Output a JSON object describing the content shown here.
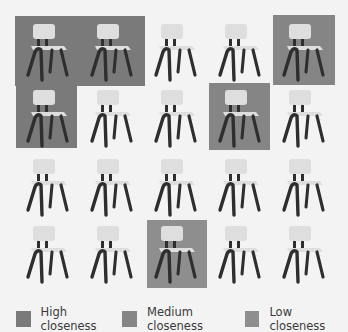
{
  "figure": {
    "grid": {
      "rows": 4,
      "cols": 5,
      "item": "chair"
    },
    "highlights": [
      {
        "label": "row0-cols0-1",
        "level": "high",
        "x": 15,
        "y": 16,
        "w": 130,
        "h": 70
      },
      {
        "label": "row1-col0",
        "level": "high",
        "x": 16,
        "y": 85,
        "w": 61,
        "h": 63
      },
      {
        "label": "row0-col4",
        "level": "medium",
        "x": 273,
        "y": 15,
        "w": 62,
        "h": 70
      },
      {
        "label": "row1-col3",
        "level": "medium",
        "x": 209,
        "y": 83,
        "w": 61,
        "h": 67
      },
      {
        "label": "row3-col2",
        "level": "low",
        "x": 147,
        "y": 220,
        "w": 60,
        "h": 68
      }
    ],
    "chairs": [
      {
        "row": 0,
        "col": 0,
        "x": 24,
        "y": 22
      },
      {
        "row": 0,
        "col": 1,
        "x": 88,
        "y": 22
      },
      {
        "row": 0,
        "col": 2,
        "x": 152,
        "y": 22
      },
      {
        "row": 0,
        "col": 3,
        "x": 216,
        "y": 22
      },
      {
        "row": 0,
        "col": 4,
        "x": 280,
        "y": 22
      },
      {
        "row": 1,
        "col": 0,
        "x": 24,
        "y": 88
      },
      {
        "row": 1,
        "col": 1,
        "x": 88,
        "y": 88
      },
      {
        "row": 1,
        "col": 2,
        "x": 152,
        "y": 88
      },
      {
        "row": 1,
        "col": 3,
        "x": 216,
        "y": 88
      },
      {
        "row": 1,
        "col": 4,
        "x": 280,
        "y": 88
      },
      {
        "row": 2,
        "col": 0,
        "x": 24,
        "y": 157
      },
      {
        "row": 2,
        "col": 1,
        "x": 88,
        "y": 157
      },
      {
        "row": 2,
        "col": 2,
        "x": 152,
        "y": 157
      },
      {
        "row": 2,
        "col": 3,
        "x": 216,
        "y": 157
      },
      {
        "row": 2,
        "col": 4,
        "x": 280,
        "y": 157
      },
      {
        "row": 3,
        "col": 0,
        "x": 24,
        "y": 224
      },
      {
        "row": 3,
        "col": 1,
        "x": 88,
        "y": 224
      },
      {
        "row": 3,
        "col": 2,
        "x": 152,
        "y": 224
      },
      {
        "row": 3,
        "col": 3,
        "x": 216,
        "y": 224
      },
      {
        "row": 3,
        "col": 4,
        "x": 280,
        "y": 224
      }
    ]
  },
  "legend": {
    "items": [
      {
        "label": "High closeness",
        "color": "#7a7a7a"
      },
      {
        "label": "Medium closeness",
        "color": "#858585"
      },
      {
        "label": "Low closeness",
        "color": "#8e8e8e"
      }
    ]
  },
  "colors": {
    "background": "#f3f3f3",
    "chair_seat": "#dedede",
    "chair_frame": "#2e2e2e"
  }
}
